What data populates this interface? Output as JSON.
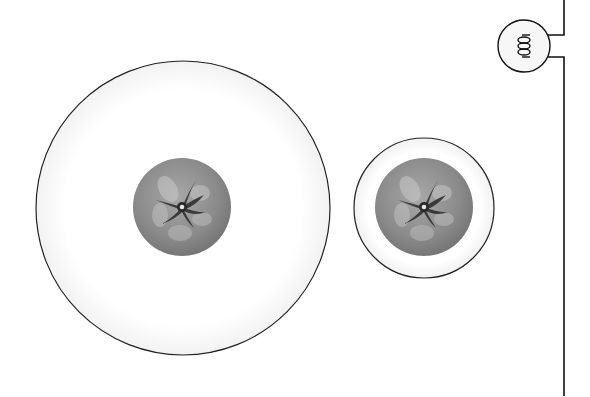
{
  "scene": {
    "description": "Two plates with a tomato on each and a light bulb circuit on the right",
    "colors": {
      "plate_stroke": "#222222",
      "plate_fill": "#ffffff",
      "plate_rim_shade": "#f3f3f3",
      "tomato_base": "#8c8c8c",
      "tomato_highlight": "#c8c8c8",
      "tomato_sepal": "#3a3a3a",
      "wire": "#111111",
      "bulb_fill": "#f7f7f7"
    },
    "objects": [
      {
        "name": "large-plate",
        "contains": "tomato"
      },
      {
        "name": "small-plate",
        "contains": "tomato"
      },
      {
        "name": "light-bulb",
        "connected_to": "wire"
      }
    ]
  }
}
